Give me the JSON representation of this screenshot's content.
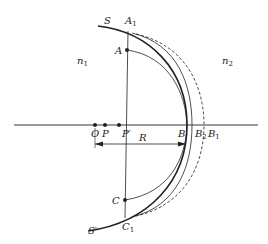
{
  "diagram": {
    "labels": {
      "S": "S",
      "S_prime": "S′",
      "A1": "A",
      "A1_sub": "1",
      "A": "A",
      "C": "C",
      "C1": "C",
      "C1_sub": "1",
      "n1": "n",
      "n1_sub": "1",
      "n2": "n",
      "n2_sub": "2",
      "O": "O",
      "P": "P",
      "P_prime": "P′",
      "R": "R",
      "B": "B",
      "B2": "B",
      "B2_sub": "2",
      "B1": "B",
      "B1_sub": "1"
    },
    "colors": {
      "stroke": "#222222",
      "background": "#ffffff"
    }
  }
}
